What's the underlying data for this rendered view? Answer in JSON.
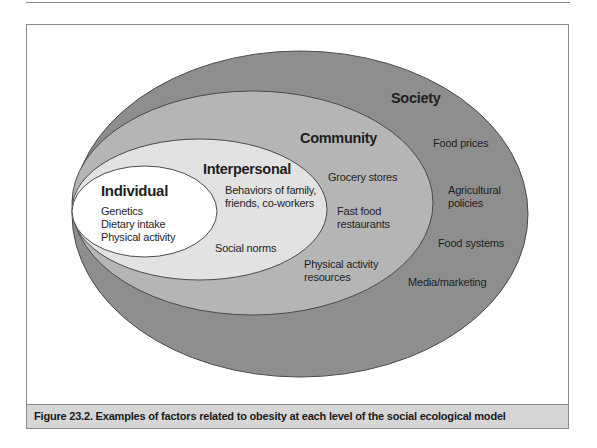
{
  "figure": {
    "caption": "Figure 23.2. Examples of factors related to obesity at each level of the social ecological model",
    "colors": {
      "society": "#8e8e8e",
      "community": "#b5b5b5",
      "interpersonal": "#e2e2e2",
      "individual": "#ffffff",
      "caption_bar": "#d6d6d6",
      "outline": "#4a4a4a"
    }
  },
  "levels": {
    "society": {
      "title": "Society",
      "items": [
        "Food prices",
        "Agricultural",
        "policies",
        "Food systems",
        "Media/marketing"
      ]
    },
    "community": {
      "title": "Community",
      "items": [
        "Grocery stores",
        "Fast food",
        "restaurants",
        "Physical activity",
        "resources"
      ]
    },
    "interpersonal": {
      "title": "Interpersonal",
      "items": [
        "Behaviors of family,",
        "friends, co-workers",
        "Social norms"
      ]
    },
    "individual": {
      "title": "Individual",
      "items": [
        "Genetics",
        "Dietary intake",
        "Physical activity"
      ]
    }
  }
}
